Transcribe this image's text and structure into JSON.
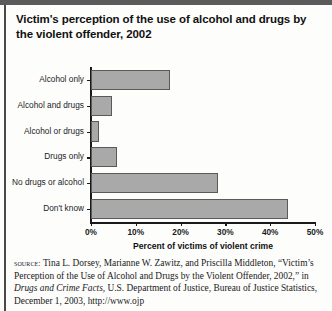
{
  "figure": {
    "title": "Victim's perception of the use of alcohol and drugs by the violent offender, 2002"
  },
  "chart_data": {
    "type": "bar",
    "orientation": "horizontal",
    "title": "Victim's perception of the use of alcohol and drugs by the violent offender, 2002",
    "xlabel": "Percent of victims of violent crime",
    "ylabel": "",
    "xlim": [
      0,
      50
    ],
    "xticks": [
      0,
      10,
      20,
      30,
      40,
      50
    ],
    "xtick_labels": [
      "0%",
      "10%",
      "20%",
      "30%",
      "40%",
      "50%"
    ],
    "grid": false,
    "legend": null,
    "bar_color": "#a9a9a9",
    "bar_edge_color": "#5a5a5a",
    "categories": [
      "Alcohol only",
      "Alcohol and drugs",
      "Alcohol or drugs",
      "Drugs only",
      "No drugs or alcohol",
      "Don't know"
    ],
    "values": [
      17.6,
      4.7,
      1.8,
      5.8,
      28.3,
      44.0
    ]
  },
  "source": {
    "label": "source:",
    "line1": " Tina L. Dorsey, Marianne W. Zawitz, and Priscilla Middleton, “Victim’s Perception of the Use of Alcohol and Drugs by the Violent Offender, 2002,” in ",
    "italic_title": "Drugs and Crime Facts",
    "line2": ", U.S. Department of Justice, Bureau of Justice Statistics, December 1, 2003, http://www.ojp"
  }
}
